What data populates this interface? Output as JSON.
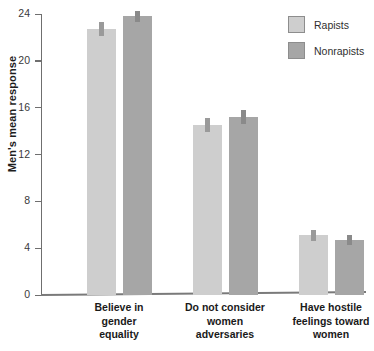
{
  "chart_data": {
    "type": "bar",
    "title": "",
    "xlabel": "",
    "ylabel": "Men's mean response",
    "ylim": [
      0,
      24
    ],
    "yticks": [
      0,
      4,
      8,
      12,
      16,
      20,
      24
    ],
    "grid": false,
    "legend_position": "top-right",
    "categories": [
      "Believe in gender equality",
      "Do not consider women adversaries",
      "Have hostile feelings toward women"
    ],
    "category_lines": [
      [
        "Believe in",
        "gender",
        "equality"
      ],
      [
        "Do not consider",
        "women",
        "adversaries"
      ],
      [
        "Have hostile",
        "feelings toward",
        "women"
      ]
    ],
    "series": [
      {
        "name": "Rapists",
        "color": "#cecece",
        "values": [
          22.7,
          14.5,
          5.1
        ],
        "errors": [
          0.6,
          0.6,
          0.45
        ]
      },
      {
        "name": "Nonrapists",
        "color": "#a6a6a6",
        "values": [
          23.8,
          15.2,
          4.7
        ],
        "errors": [
          0.5,
          0.6,
          0.4
        ]
      }
    ],
    "error_bars": true
  },
  "legend": {
    "items": [
      {
        "label": "Rapists",
        "color": "#cecece"
      },
      {
        "label": "Nonrapists",
        "color": "#a6a6a6"
      }
    ]
  },
  "axis": {
    "y_title": "Men's mean response",
    "tick_labels": [
      "24",
      "20",
      "16",
      "12",
      "8",
      "4",
      "0"
    ]
  }
}
